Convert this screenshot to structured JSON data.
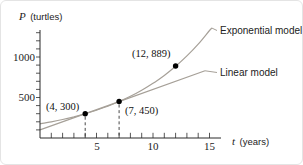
{
  "figure": {
    "y_axis_var": "P",
    "y_axis_unit": "(turtles)",
    "x_axis_var": "t",
    "x_axis_unit": "(years)",
    "y_tick_labels": {
      "v1000": "1000",
      "v500": "500"
    },
    "x_tick_labels": {
      "v5": "5",
      "v10": "10",
      "v15": "15"
    },
    "curve_labels": {
      "exponential": "Exponential model",
      "linear": "Linear model"
    },
    "colors": {
      "curve": "#a6a098",
      "axis": "#2b2b2b",
      "point": "#000000",
      "dashed": "#333333"
    }
  },
  "chart_data": {
    "type": "line",
    "title": "",
    "xlabel": "t (years)",
    "ylabel": "P (turtles)",
    "xlim": [
      0,
      16
    ],
    "ylim": [
      0,
      1340
    ],
    "x_labeled_ticks": [
      5,
      10,
      15
    ],
    "y_labeled_ticks": [
      500,
      1000
    ],
    "x_minor_tick_step": 1,
    "x_minor_tick_max": 15,
    "y_minor_tick_step": 100,
    "y_minor_tick_max": 1300,
    "grid": false,
    "legend_position": "right-of-curve-ends",
    "points": [
      {
        "t": 4,
        "P": 300,
        "label": "(4, 300)"
      },
      {
        "t": 7,
        "P": 450,
        "label": "(7, 450)"
      },
      {
        "t": 12,
        "P": 889,
        "label": "(12, 889)"
      }
    ],
    "dashed_droplines_from_points": [
      0,
      1
    ],
    "series": [
      {
        "name": "Exponential model",
        "x": [
          0,
          1,
          2,
          3,
          4,
          5,
          6,
          7,
          8,
          9,
          10,
          11,
          12,
          13,
          14,
          15,
          15.2
        ],
        "y": [
          174,
          200,
          228,
          261,
          300,
          343,
          393,
          450,
          515,
          590,
          675,
          773,
          885,
          1013,
          1159,
          1327,
          1358
        ]
      },
      {
        "name": "Linear model",
        "x": [
          0,
          14.6
        ],
        "y": [
          100,
          830
        ]
      }
    ]
  }
}
